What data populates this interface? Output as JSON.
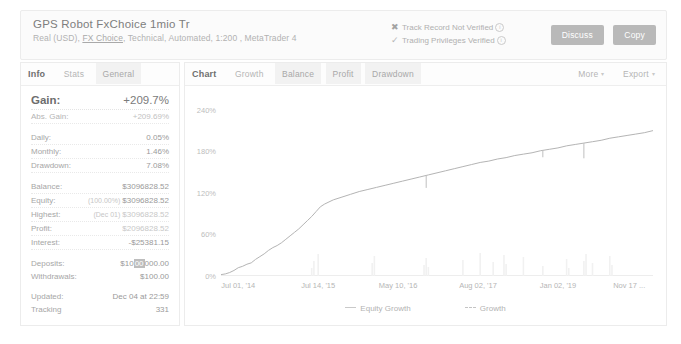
{
  "header": {
    "account_title": "GPS Robot FxChoice 1mio Tr",
    "account_sub_pre": "Real (USD), ",
    "broker": "FX Choice",
    "account_sub_post": ", Technical, Automated, 1:200 , MetaTrader 4",
    "verification": [
      {
        "icon": "cross-icon",
        "mark": "✖",
        "label": "Track Record Not Verified"
      },
      {
        "icon": "check-icon",
        "mark": "✓",
        "label": "Trading Privileges Verified"
      }
    ],
    "info_glyph": "i",
    "buttons": [
      {
        "name": "discuss-button",
        "label": "Discuss"
      },
      {
        "name": "copy-button",
        "label": "Copy"
      }
    ]
  },
  "left_panel": {
    "tabs": [
      {
        "label": "Info",
        "state": "title"
      },
      {
        "label": "Stats",
        "state": "normal"
      },
      {
        "label": "General",
        "state": "selected"
      }
    ],
    "stats": {
      "gain": {
        "label": "Gain:",
        "value": "+209.7%"
      },
      "abs_gain": {
        "label": "Abs. Gain:",
        "value": "+209.69%"
      },
      "daily": {
        "label": "Daily:",
        "value": "0.05%"
      },
      "monthly": {
        "label": "Monthly:",
        "value": "1.46%"
      },
      "drawdown": {
        "label": "Drawdown:",
        "value": "7.08%"
      },
      "balance": {
        "label": "Balance:",
        "value": "$3096828.52"
      },
      "equity": {
        "label": "Equity:",
        "paren": "(100.00%)",
        "value": "$3096828.52"
      },
      "highest": {
        "label": "Highest:",
        "paren": "(Dec 01)",
        "value": "$3096828.52"
      },
      "profit": {
        "label": "Profit:",
        "value": "$2096828.52"
      },
      "interest": {
        "label": "Interest:",
        "value": "-$25381.15"
      },
      "deposits": {
        "label": "Deposits:",
        "value_pre": "$10",
        "value_hl": "00",
        "value_post": "000.00"
      },
      "withdrawals": {
        "label": "Withdrawals:",
        "value": "$100.00"
      },
      "updated": {
        "label": "Updated:",
        "value": "Dec 04 at 22:59"
      },
      "tracking": {
        "label": "Tracking",
        "value": "331"
      }
    }
  },
  "right_panel": {
    "tabs": [
      {
        "label": "Chart",
        "state": "title"
      },
      {
        "label": "Growth",
        "state": "normal"
      },
      {
        "label": "Balance",
        "state": "selected"
      },
      {
        "label": "Profit",
        "state": "selected"
      },
      {
        "label": "Drawdown",
        "state": "selected"
      }
    ],
    "more_label": "More",
    "export_label": "Export",
    "caret": "▾"
  },
  "chart_data": {
    "type": "line",
    "title": "",
    "xlabel": "",
    "ylabel": "",
    "ylim": [
      0,
      260
    ],
    "ytick_labels": [
      "240%",
      "180%",
      "120%",
      "60%",
      "0%"
    ],
    "ytick_values": [
      240,
      180,
      120,
      60,
      0
    ],
    "xtick_labels": [
      "Jul 01, '14",
      "Jul 14, '15",
      "May 10, '16",
      "Aug 02, '17",
      "Jan 02, '19",
      "Nov 17 ..."
    ],
    "xtick_positions": [
      0.04,
      0.225,
      0.41,
      0.595,
      0.78,
      0.945
    ],
    "grid": false,
    "legend_position": "bottom",
    "legend": [
      {
        "name": "Equity Growth",
        "style": "solid"
      },
      {
        "name": "Growth",
        "style": "dashed"
      }
    ],
    "series": [
      {
        "name": "Growth",
        "x": [
          0.0,
          0.01,
          0.02,
          0.03,
          0.04,
          0.05,
          0.06,
          0.07,
          0.08,
          0.09,
          0.1,
          0.11,
          0.12,
          0.13,
          0.14,
          0.15,
          0.16,
          0.17,
          0.18,
          0.19,
          0.2,
          0.21,
          0.22,
          0.23,
          0.24,
          0.25,
          0.26,
          0.28,
          0.3,
          0.32,
          0.34,
          0.36,
          0.38,
          0.4,
          0.42,
          0.44,
          0.46,
          0.48,
          0.5,
          0.52,
          0.54,
          0.56,
          0.58,
          0.6,
          0.62,
          0.64,
          0.66,
          0.68,
          0.7,
          0.72,
          0.74,
          0.76,
          0.78,
          0.8,
          0.82,
          0.84,
          0.86,
          0.88,
          0.9,
          0.92,
          0.94,
          0.96,
          0.98,
          1.0
        ],
        "y": [
          2,
          3,
          5,
          8,
          12,
          14,
          17,
          19,
          24,
          28,
          32,
          37,
          41,
          44,
          48,
          53,
          58,
          63,
          68,
          74,
          80,
          86,
          93,
          100,
          104,
          107,
          110,
          114,
          118,
          122,
          125,
          128,
          131,
          134,
          137,
          140,
          143,
          146,
          149,
          152,
          155,
          158,
          161,
          164,
          166,
          169,
          171,
          174,
          176,
          178,
          181,
          183,
          185,
          188,
          190,
          192,
          194,
          196,
          199,
          201,
          203,
          205,
          207,
          210
        ]
      }
    ],
    "drawdown_spikes": [
      {
        "x": 0.475,
        "depth": 18
      },
      {
        "x": 0.745,
        "depth": 10
      },
      {
        "x": 0.84,
        "depth": 22
      }
    ]
  }
}
